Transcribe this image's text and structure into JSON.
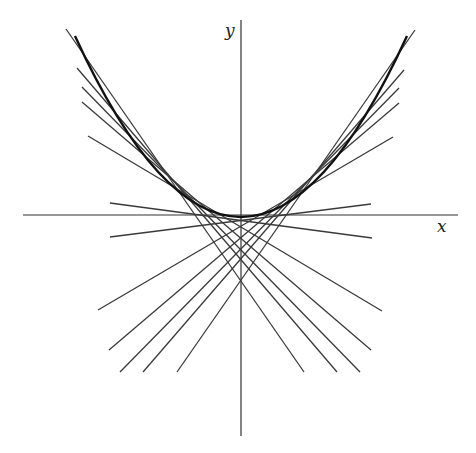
{
  "diagram": {
    "axes": {
      "x_label": "x",
      "y_label": "y",
      "x_axis": {
        "x1": 23,
        "y1": 215,
        "x2": 458,
        "y2": 215
      },
      "y_axis": {
        "x1": 241,
        "y1": 20,
        "x2": 241,
        "y2": 436
      }
    },
    "parabola": {
      "left": [
        75,
        36
      ],
      "control": [
        241,
        398
      ],
      "right": [
        407,
        36
      ]
    },
    "tangent_lines": [
      {
        "x1": 66,
        "y1": 29,
        "x2": 304,
        "y2": 372
      },
      {
        "x1": 77,
        "y1": 68,
        "x2": 337,
        "y2": 372
      },
      {
        "x1": 82,
        "y1": 87,
        "x2": 360,
        "y2": 372
      },
      {
        "x1": 82,
        "y1": 102,
        "x2": 371,
        "y2": 350
      },
      {
        "x1": 88,
        "y1": 136,
        "x2": 382,
        "y2": 311
      },
      {
        "x1": 110,
        "y1": 203,
        "x2": 372,
        "y2": 238
      },
      {
        "x1": 415,
        "y1": 30,
        "x2": 177,
        "y2": 372
      },
      {
        "x1": 404,
        "y1": 70,
        "x2": 143,
        "y2": 372
      },
      {
        "x1": 399,
        "y1": 88,
        "x2": 120,
        "y2": 372
      },
      {
        "x1": 399,
        "y1": 103,
        "x2": 109,
        "y2": 350
      },
      {
        "x1": 393,
        "y1": 137,
        "x2": 98,
        "y2": 310
      },
      {
        "x1": 371,
        "y1": 204,
        "x2": 110,
        "y2": 237
      }
    ]
  }
}
